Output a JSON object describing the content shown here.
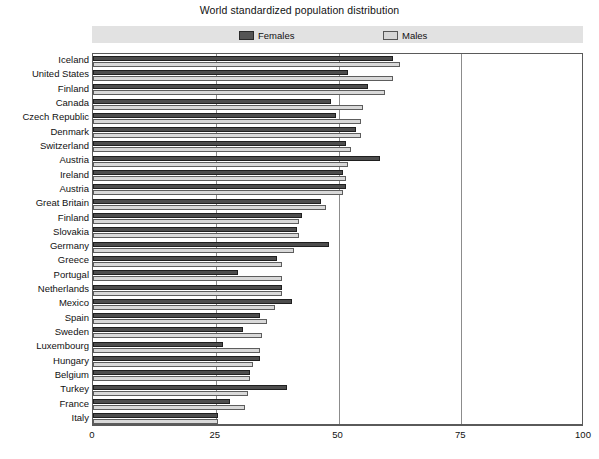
{
  "chart_data": {
    "type": "bar",
    "orientation": "horizontal",
    "title": "World standardized population distribution",
    "xlabel": "",
    "ylabel": "",
    "xlim": [
      0,
      100
    ],
    "xticks": [
      0,
      25,
      50,
      75,
      100
    ],
    "grid": true,
    "gridlines_at": [
      25,
      50,
      75
    ],
    "legend": {
      "position": "top",
      "entries": [
        {
          "name": "Females",
          "color": "#4d4d4d"
        },
        {
          "name": "Males",
          "color": "#d9d9d9"
        }
      ]
    },
    "categories": [
      "Iceland",
      "United States",
      "Finland",
      "Canada",
      "Czech Republic",
      "Denmark",
      "Switzerland",
      "Austria",
      "Ireland",
      "Austria",
      "Great Britain",
      "Finland",
      "Slovakia",
      "Germany",
      "Greece",
      "Portugal",
      "Netherlands",
      "Mexico",
      "Spain",
      "Sweden",
      "Luxembourg",
      "Hungary",
      "Belgium",
      "Turkey",
      "France",
      "Italy"
    ],
    "series": [
      {
        "name": "Females",
        "color": "#4d4d4d",
        "values": [
          61.0,
          52.0,
          56.0,
          48.5,
          49.5,
          53.5,
          51.5,
          58.5,
          51.0,
          51.5,
          46.5,
          42.5,
          41.5,
          48.0,
          37.5,
          29.5,
          38.5,
          40.5,
          34.0,
          30.5,
          26.5,
          34.0,
          32.0,
          39.5,
          28.0,
          25.5
        ]
      },
      {
        "name": "Males",
        "color": "#d9d9d9",
        "values": [
          62.5,
          61.0,
          59.5,
          55.0,
          54.5,
          54.5,
          52.5,
          52.0,
          51.5,
          51.0,
          47.5,
          42.0,
          42.0,
          41.0,
          38.5,
          38.5,
          38.5,
          37.0,
          35.5,
          34.5,
          34.0,
          32.5,
          32.0,
          31.5,
          31.0,
          25.5
        ]
      }
    ]
  },
  "axis": {
    "x_tick_labels": [
      "0",
      "25",
      "50",
      "75",
      "100"
    ]
  }
}
